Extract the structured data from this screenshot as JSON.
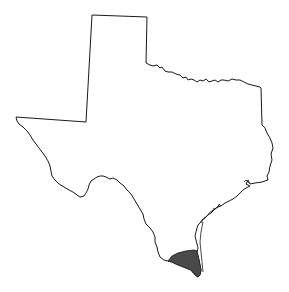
{
  "map": {
    "subject": "Texas state outline",
    "outline_color": "#1a1a1a",
    "background_color": "#ffffff",
    "highlight": {
      "label": "South Texas region (Rio Grande Valley / lower coast)",
      "fill_color": "#4a4a4a"
    }
  }
}
